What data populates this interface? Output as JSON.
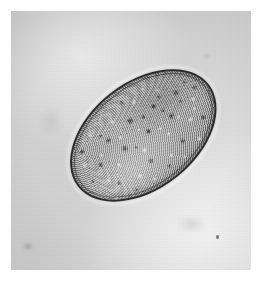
{
  "image": {
    "kind": "light-micrograph",
    "title": "Light micrograph of a single ovoid cell",
    "description": "Grayscale photographic print showing one large ellipsoidal cell (ovum) with a dark membrane rim and densely granular cytoplasm, lying on a plain pale-gray field.",
    "width_px": 269,
    "height_px": 281,
    "orientation_note": "Long axis runs from lower-left to upper-right",
    "colors": {
      "paper_border": "#ffffff",
      "background_field": "#d2d2d2",
      "background_light": "#e8e8e8",
      "background_dark": "#c9c9c9",
      "membrane_rim": "#2b2b2b",
      "cytoplasm_mid": "#9b9b9b",
      "cytoplasm_dark_granule": "#1a1a1a",
      "cytoplasm_light_granule": "#f0f0f0"
    }
  },
  "print": {
    "border_left_px": 11,
    "border_top_px": 11,
    "field_width_px": 240,
    "field_height_px": 259
  },
  "specimen": {
    "name": "ovoid-cell",
    "center_x_px": 143,
    "center_y_px": 135,
    "major_axis_px": 166,
    "minor_axis_px": 107,
    "rotation_deg": -38,
    "membrane_thickness_px": 2,
    "parts": [
      {
        "name": "membrane",
        "label": "cell membrane / chorion"
      },
      {
        "name": "cytoplasm",
        "label": "granular cytoplasm"
      },
      {
        "name": "granules",
        "label": "yolk granules"
      }
    ]
  },
  "artifacts": [
    {
      "name": "speck-right",
      "x_px": 216,
      "y_px": 235,
      "label": "dark debris speck"
    },
    {
      "name": "speck-lowerleft",
      "x_px": 25,
      "y_px": 245,
      "label": "faint smudge"
    },
    {
      "name": "speck-topright",
      "x_px": 203,
      "y_px": 55,
      "label": "faint speck"
    }
  ]
}
